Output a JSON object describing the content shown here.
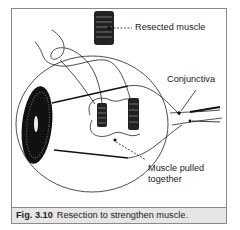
{
  "figure": {
    "number": "Fig. 3.10",
    "caption": "Resection to strengthen muscle."
  },
  "labels": {
    "resected_muscle": "Resected muscle",
    "conjunctiva": "Conjunctiva",
    "muscle_pulled_line1": "Muscle pulled",
    "muscle_pulled_line2": "together"
  },
  "colors": {
    "frame_border": "#8a8a8a",
    "caption_bg": "#e6e6e6",
    "ink": "#1a1a1a"
  }
}
